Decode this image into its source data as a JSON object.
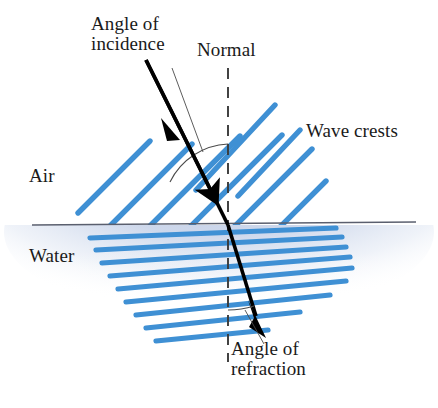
{
  "figure": {
    "type": "physics-diagram",
    "width": 438,
    "height": 408,
    "background_color": "#ffffff"
  },
  "labels": {
    "angle_of_incidence": "Angle of\nincidence",
    "normal": "Normal",
    "wave_crests": "Wave crests",
    "air": "Air",
    "water": "Water",
    "angle_of_refraction": "Angle of\nrefraction"
  },
  "colors": {
    "wave_crest": "#3f90d4",
    "wave_crest_dark": "#2a7ec2",
    "ray": "#000000",
    "normal_line": "#3a3a3a",
    "surface_line": "#5a5f6e",
    "water_tint": "#c3cfe6",
    "text": "#1a1a1a",
    "leader_line": "#4a4a4a"
  },
  "geometry": {
    "surface_y": 225,
    "incidence_point": {
      "x": 228,
      "y": 225
    },
    "normal_x": 228,
    "normal_top_y": 68,
    "normal_bottom_y": 362,
    "incident_ray": {
      "x1": 152,
      "y1": 72,
      "x2": 228,
      "y2": 225
    },
    "refracted_ray": {
      "x1": 228,
      "y1": 225,
      "x2": 262,
      "y2": 334
    },
    "air_crest_count": 6,
    "water_crest_count": 9,
    "air_crest_angle_deg": 45,
    "water_crest_angle_deg": 12
  },
  "annotations": {
    "incidence_arc_label": "angle between incident ray and normal",
    "refraction_arc_label": "angle between refracted ray and normal"
  }
}
